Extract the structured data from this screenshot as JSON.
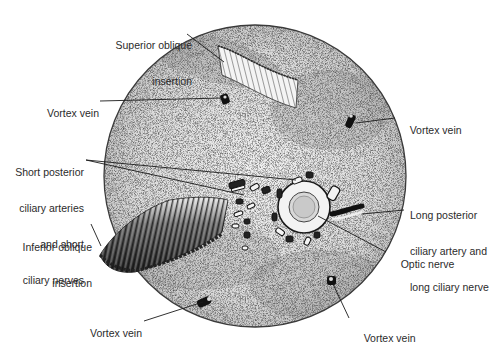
{
  "figure": {
    "colors": {
      "background": "#ffffff",
      "globe_fill": "#e9e9e9",
      "globe_outline": "#3a3a3a",
      "ink": "#1a1a1a",
      "label_text": "#2b2b2b"
    }
  },
  "labels": {
    "superior_oblique": {
      "line1": "Superior oblique",
      "line2": "insertion"
    },
    "vortex_vein_upper_left": "Vortex vein",
    "vortex_vein_upper_right": "Vortex vein",
    "short_posterior": {
      "line1": "Short posterior",
      "line2": "ciliary arteries",
      "line3": "and short",
      "line4": "ciliary nerves"
    },
    "inferior_oblique": {
      "line1": "Inferior oblique",
      "line2": "insertion"
    },
    "long_posterior": {
      "line1": "Long posterior",
      "line2": "ciliary artery and",
      "line3": "long ciliary nerve"
    },
    "optic_nerve": "Optic nerve",
    "vortex_vein_lower_left": "Vortex vein",
    "vortex_vein_lower_right": "Vortex vein"
  }
}
